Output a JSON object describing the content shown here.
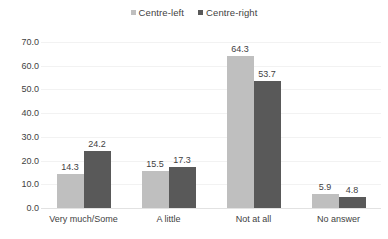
{
  "chart_data": {
    "type": "bar",
    "title": "",
    "xlabel": "",
    "ylabel": "",
    "categories": [
      "Very much/Some",
      "A little",
      "Not at all",
      "No answer"
    ],
    "series": [
      {
        "name": "Centre-left",
        "color": "#bfbfbf",
        "values": [
          14.3,
          15.5,
          64.3,
          5.9
        ],
        "value_labels": [
          "14.3",
          "15.5",
          "64.3",
          "5.9"
        ]
      },
      {
        "name": "Centre-right",
        "color": "#595959",
        "values": [
          24.2,
          17.3,
          53.7,
          4.8
        ],
        "value_labels": [
          "24.2",
          "17.3",
          "53.7",
          "4.8"
        ]
      }
    ],
    "ylim": [
      0.0,
      70.0
    ],
    "ytick_step": 10.0,
    "ytick_labels": [
      "70.0",
      "60.0",
      "50.0",
      "40.0",
      "30.0",
      "20.0",
      "10.0",
      "0.0"
    ],
    "ytick_values": [
      70.0,
      60.0,
      50.0,
      40.0,
      30.0,
      20.0,
      10.0,
      0.0
    ],
    "grid": true,
    "legend_position": "top"
  },
  "legend": {
    "entries": [
      {
        "label": "Centre-left",
        "color": "#bfbfbf"
      },
      {
        "label": "Centre-right",
        "color": "#595959"
      }
    ]
  },
  "colors": {
    "centre_left": "#bfbfbf",
    "centre_right": "#595959",
    "gridline": "#f2f2f2",
    "axis": "#e2e2e2",
    "text": "#3f3f3f",
    "background": "#ffffff"
  }
}
